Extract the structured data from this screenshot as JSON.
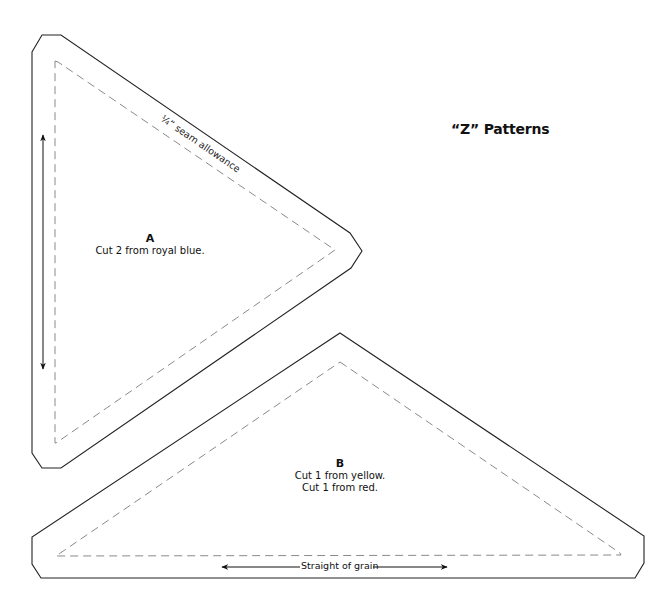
{
  "title": "“Z” Patterns",
  "pieces": [
    {
      "id": "A",
      "letter": "A",
      "instructions": [
        "Cut 2 from royal blue."
      ],
      "seam_label": "¼” seam allowance",
      "grain_arrow": "vertical"
    },
    {
      "id": "B",
      "letter": "B",
      "instructions": [
        "Cut 1 from yellow.",
        "Cut 1 from red."
      ],
      "grain_label": "Straight of grain",
      "grain_arrow": "horizontal"
    }
  ],
  "colors": {
    "cut_line": "#222222",
    "seam_line": "#8a8a8a",
    "text": "#111111",
    "background": "#ffffff"
  }
}
